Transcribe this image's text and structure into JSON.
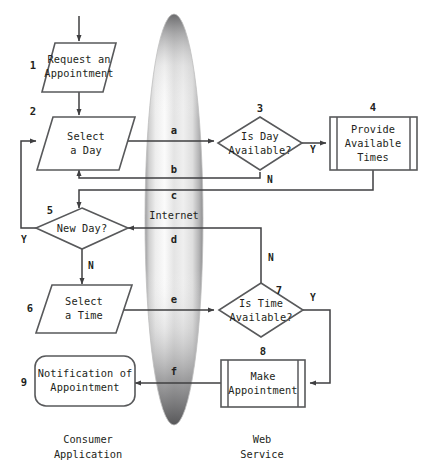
{
  "diagram": {
    "canvas": {
      "width": 424,
      "height": 475
    },
    "colors": {
      "shape_stroke": "#58595b",
      "connector_stroke": "#3f3f41",
      "text": "#231f20",
      "shape_fill": "#ffffff",
      "cloud_light": "#ffffff",
      "cloud_mid": "#d8d8d8",
      "cloud_dark": "#6e6e70",
      "background": "#ffffff"
    },
    "nodes": [
      {
        "id": "n1",
        "number": "1",
        "label_lines": [
          "Request an",
          "Appointment"
        ],
        "shape": "parallelogram",
        "lane": "consumer"
      },
      {
        "id": "n2",
        "number": "2",
        "label_lines": [
          "Select",
          "a Day"
        ],
        "shape": "parallelogram",
        "lane": "consumer"
      },
      {
        "id": "n3",
        "number": "3",
        "label_lines": [
          "Is Day",
          "Available?"
        ],
        "shape": "diamond",
        "lane": "web-service"
      },
      {
        "id": "n4",
        "number": "4",
        "label_lines": [
          "Provide",
          "Available",
          "Times"
        ],
        "shape": "predefined-process",
        "lane": "web-service"
      },
      {
        "id": "n5",
        "number": "5",
        "label_lines": [
          "New Day?"
        ],
        "shape": "diamond",
        "lane": "consumer"
      },
      {
        "id": "n6",
        "number": "6",
        "label_lines": [
          "Select",
          "a Time"
        ],
        "shape": "parallelogram",
        "lane": "consumer"
      },
      {
        "id": "n7",
        "number": "7",
        "label_lines": [
          "Is Time",
          "Available?"
        ],
        "shape": "diamond",
        "lane": "web-service"
      },
      {
        "id": "n8",
        "number": "8",
        "label_lines": [
          "Make",
          "Appointment"
        ],
        "shape": "predefined-process",
        "lane": "web-service"
      },
      {
        "id": "n9",
        "number": "9",
        "label_lines": [
          "Notification of",
          "Appointment"
        ],
        "shape": "rounded-rectangle",
        "lane": "consumer"
      }
    ],
    "cloud": {
      "label": "Internet",
      "shape": "vertical-ellipse"
    },
    "link_labels": [
      {
        "id": "a",
        "text": "a",
        "from": "n2",
        "to": "n3"
      },
      {
        "id": "b",
        "text": "b",
        "from": "n3",
        "to": "n2"
      },
      {
        "id": "c",
        "text": "c",
        "from": "n4",
        "to": "n5"
      },
      {
        "id": "d",
        "text": "d",
        "from": "n7",
        "to": "n5"
      },
      {
        "id": "e",
        "text": "e",
        "from": "n6",
        "to": "n7"
      },
      {
        "id": "f",
        "text": "f",
        "from": "n8",
        "to": "n9"
      }
    ],
    "branch_labels": [
      {
        "id": "n3-yes",
        "text": "Y",
        "node": "n3"
      },
      {
        "id": "n3-no",
        "text": "N",
        "node": "n3"
      },
      {
        "id": "n5-yes",
        "text": "Y",
        "node": "n5"
      },
      {
        "id": "n5-no",
        "text": "N",
        "node": "n5"
      },
      {
        "id": "n7-yes",
        "text": "Y",
        "node": "n7"
      },
      {
        "id": "n7-no",
        "text": "N",
        "node": "n7"
      }
    ],
    "lanes": [
      {
        "id": "consumer",
        "label_lines": [
          "Consumer",
          "Application"
        ]
      },
      {
        "id": "web-service",
        "label_lines": [
          "Web",
          "Service"
        ]
      }
    ]
  }
}
